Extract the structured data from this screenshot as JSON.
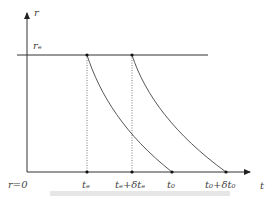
{
  "diagram": {
    "axes": {
      "y_label": "r",
      "x_label": "t",
      "origin_label": "r=0"
    },
    "level_label": "rₑ",
    "x_ticks": [
      {
        "label": "tₑ",
        "x": 87
      },
      {
        "label": "tₑ+δtₑ",
        "x": 132
      },
      {
        "label": "t₀",
        "x": 172
      },
      {
        "label": "t₀+δt₀",
        "x": 226
      }
    ],
    "curves": [
      {
        "from": "tₑ",
        "to": "t₀"
      },
      {
        "from": "tₑ+δtₑ",
        "to": "t₀+δt₀"
      }
    ],
    "line_color": "#333333",
    "caption": ""
  }
}
